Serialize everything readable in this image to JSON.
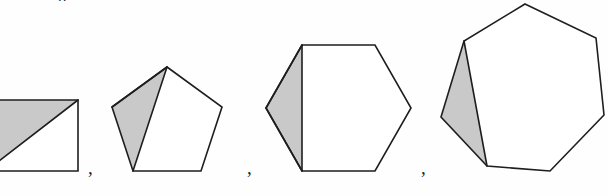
{
  "figure": {
    "caption_fragment_above": "p",
    "background_color": "#fefefe",
    "stroke_color": "#1e1e1e",
    "fill_color": "#ffffff",
    "shade_color": "#c9c9c9",
    "stroke_width": 1.6,
    "separators": [
      {
        "label": ",",
        "x": 88,
        "y": 158
      },
      {
        "label": ",",
        "x": 247,
        "y": 158
      },
      {
        "label": ",",
        "x": 421,
        "y": 158
      }
    ],
    "shapes": [
      {
        "name": "square",
        "sides": 4,
        "label": "square-quadrilateral",
        "clipped_at_left_edge": true,
        "outline_points": "-14,100 78,100 78,171 -14,171",
        "shaded_triangle_points": "-14,100 78,100 -14,171",
        "interior_diagonals": [
          {
            "from": "78,100",
            "to": "-14,171"
          }
        ]
      },
      {
        "name": "pentagon",
        "sides": 5,
        "label": "regular-pentagon",
        "clipped_at_left_edge": false,
        "outline_points": "167,67 222,107 201,171 133,171 112,107",
        "shaded_triangle_points": "167,67 112,107 133,171",
        "interior_diagonals": [
          {
            "from": "167,67",
            "to": "112,107"
          },
          {
            "from": "167,67",
            "to": "133,171"
          }
        ]
      },
      {
        "name": "hexagon",
        "sides": 6,
        "label": "regular-hexagon",
        "clipped_at_left_edge": false,
        "outline_points": "302,45 375,45 411,108 375,171 302,171 266,108",
        "shaded_triangle_points": "302,45 266,108 302,171",
        "interior_diagonals": [
          {
            "from": "302,45",
            "to": "266,108"
          },
          {
            "from": "266,108",
            "to": "302,171"
          },
          {
            "from": "302,45",
            "to": "302,171"
          }
        ]
      },
      {
        "name": "heptagon",
        "sides": 7,
        "label": "regular-heptagon",
        "clipped_at_left_edge": false,
        "outline_points": "525,4 596,38 604,115 550,171 487,166 441,117 464,41",
        "shaded_triangle_points": "464,41 441,117 487,166",
        "interior_diagonals": [
          {
            "from": "464,41",
            "to": "487,166"
          }
        ]
      }
    ]
  }
}
